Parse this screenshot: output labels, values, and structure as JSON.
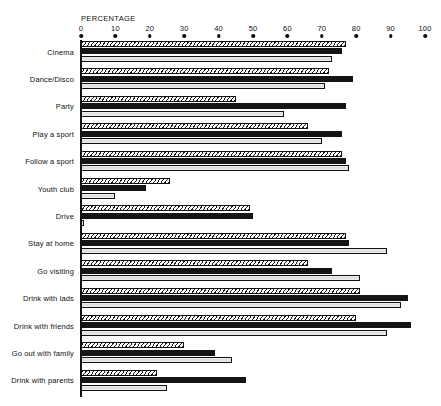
{
  "chart_data": {
    "type": "bar",
    "orientation": "horizontal",
    "title": "",
    "xlabel": "PERCENTAGE",
    "ylabel": "",
    "xlim": [
      0,
      100
    ],
    "xticks": [
      0,
      10,
      20,
      30,
      40,
      50,
      60,
      70,
      80,
      90,
      100
    ],
    "xtick_labels": [
      "0",
      "10",
      "20",
      "30",
      "40",
      "50",
      "60",
      "70",
      "80",
      "90",
      "100"
    ],
    "grid": false,
    "legend": "none",
    "categories": [
      "Cinema",
      "Dance/Disco",
      "Party",
      "Play a sport",
      "Follow a sport",
      "Youth club",
      "Drive",
      "Stay at home",
      "Go visiting",
      "Drink with lads",
      "Drink with friends",
      "Go out with family",
      "Drink with parents"
    ],
    "series": [
      {
        "name": "series-1",
        "style": "hatched",
        "values": [
          77,
          72,
          45,
          66,
          76,
          26,
          49,
          77,
          66,
          81,
          80,
          30,
          22
        ]
      },
      {
        "name": "series-2",
        "style": "solid-black",
        "values": [
          76,
          79,
          77,
          76,
          77,
          19,
          50,
          78,
          73,
          95,
          96,
          39,
          48
        ]
      },
      {
        "name": "series-3",
        "style": "light-grey",
        "values": [
          73,
          71,
          59,
          70,
          78,
          10,
          1,
          89,
          81,
          93,
          89,
          44,
          25
        ]
      }
    ]
  },
  "colors": {
    "ink": "#141414",
    "hatch": "#1a1a1a",
    "light": "#e4e4e4",
    "background": "#ffffff"
  }
}
